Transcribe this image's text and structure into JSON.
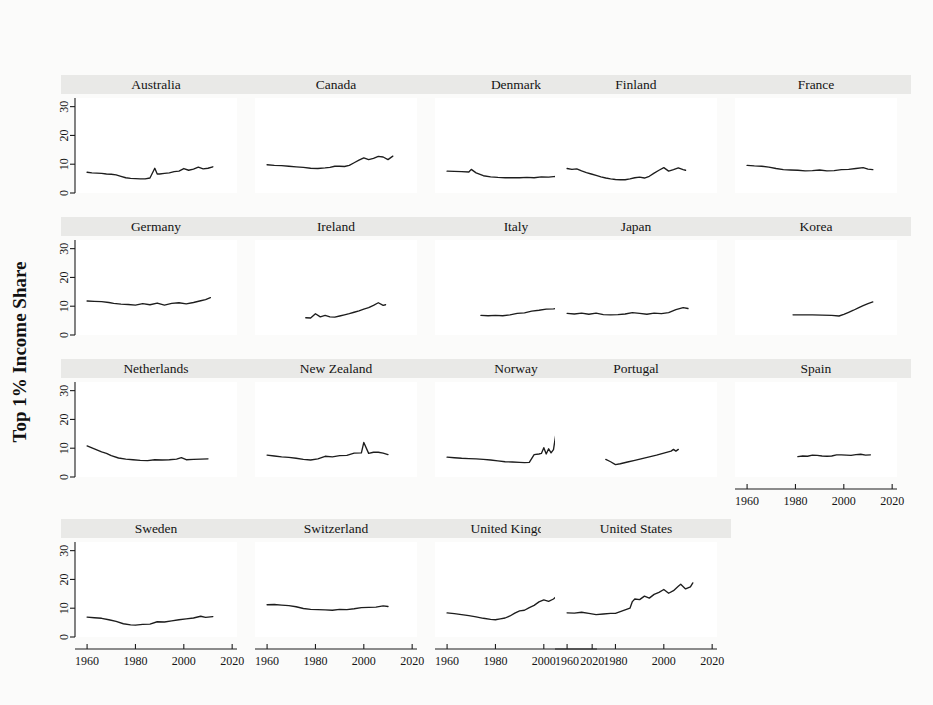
{
  "figure": {
    "ylabel": "Top 1% Income Share",
    "background_color": "#fbfbfa",
    "panel_background_color": "#ffffff",
    "title_band_color": "#e9e9e7",
    "line_color": "#1d1d1d"
  },
  "chart_data": {
    "type": "line",
    "title": "",
    "subtitle": "",
    "xlabel": "",
    "ylabel": "Top 1% Income Share",
    "xlim": [
      1955,
      2022
    ],
    "ylim": [
      0,
      33
    ],
    "xticks": [
      1960,
      1980,
      2000,
      2020
    ],
    "xtick_labels": [
      "1960",
      "1980",
      "2000",
      "2020"
    ],
    "yticks": [
      0,
      10,
      20,
      30
    ],
    "ytick_labels": [
      "0",
      "10",
      "20",
      "30"
    ],
    "grid": false,
    "legend": "none",
    "layout": {
      "rows": 4,
      "cols": 5,
      "panels": 19
    },
    "panels": [
      {
        "name": "Australia",
        "row": 0,
        "col": 0,
        "x": [
          1960,
          1962,
          1964,
          1966,
          1968,
          1970,
          1972,
          1974,
          1976,
          1978,
          1980,
          1982,
          1984,
          1986,
          1988,
          1989,
          1990,
          1992,
          1994,
          1996,
          1998,
          2000,
          2002,
          2004,
          2006,
          2008,
          2010,
          2012
        ],
        "y": [
          7.2,
          7.0,
          6.9,
          6.8,
          6.6,
          6.5,
          6.3,
          5.8,
          5.3,
          5.1,
          5.0,
          4.9,
          4.9,
          5.2,
          8.6,
          6.6,
          6.6,
          6.8,
          7.0,
          7.4,
          7.6,
          8.5,
          7.9,
          8.3,
          9.0,
          8.4,
          8.6,
          9.1
        ]
      },
      {
        "name": "Canada",
        "row": 0,
        "col": 1,
        "x": [
          1960,
          1963,
          1966,
          1969,
          1972,
          1975,
          1978,
          1981,
          1984,
          1986,
          1988,
          1990,
          1992,
          1994,
          1996,
          1998,
          2000,
          2002,
          2004,
          2006,
          2008,
          2010,
          2012
        ],
        "y": [
          9.8,
          9.6,
          9.5,
          9.3,
          9.1,
          8.9,
          8.6,
          8.5,
          8.7,
          8.9,
          9.3,
          9.3,
          9.2,
          9.6,
          10.5,
          11.4,
          12.2,
          11.6,
          12.0,
          12.7,
          12.5,
          11.6,
          12.8
        ]
      },
      {
        "name": "Denmark",
        "row": 0,
        "col": 2,
        "x": [
          1960,
          1963,
          1966,
          1969,
          1970,
          1972,
          1975,
          1978,
          1981,
          1984,
          1987,
          1990,
          1993,
          1996,
          1999,
          2002,
          2005,
          2008,
          2010
        ],
        "y": [
          7.6,
          7.5,
          7.4,
          7.3,
          8.2,
          7.0,
          6.0,
          5.6,
          5.4,
          5.3,
          5.3,
          5.3,
          5.4,
          5.3,
          5.6,
          5.5,
          5.8,
          5.6,
          5.6
        ]
      },
      {
        "name": "Finland",
        "row": 0,
        "col": 3,
        "x": [
          1960,
          1962,
          1964,
          1966,
          1968,
          1970,
          1972,
          1974,
          1976,
          1978,
          1980,
          1982,
          1984,
          1986,
          1988,
          1990,
          1992,
          1994,
          1996,
          1998,
          2000,
          2002,
          2004,
          2006,
          2008,
          2009
        ],
        "y": [
          8.5,
          8.2,
          8.4,
          7.7,
          7.1,
          6.6,
          6.1,
          5.6,
          5.2,
          4.9,
          4.7,
          4.6,
          4.6,
          4.9,
          5.3,
          5.5,
          5.2,
          5.8,
          6.9,
          7.9,
          8.8,
          7.6,
          8.1,
          8.7,
          8.1,
          7.9
        ]
      },
      {
        "name": "France",
        "row": 0,
        "col": 4,
        "x": [
          1960,
          1963,
          1966,
          1969,
          1972,
          1975,
          1978,
          1981,
          1984,
          1987,
          1990,
          1993,
          1996,
          1999,
          2002,
          2005,
          2008,
          2010,
          2012
        ],
        "y": [
          9.6,
          9.4,
          9.3,
          9.0,
          8.5,
          8.1,
          8.0,
          7.9,
          7.7,
          7.8,
          8.0,
          7.7,
          7.8,
          8.1,
          8.2,
          8.5,
          8.8,
          8.3,
          8.1
        ]
      },
      {
        "name": "Germany",
        "row": 1,
        "col": 0,
        "x": [
          1960,
          1963,
          1966,
          1969,
          1971,
          1974,
          1977,
          1980,
          1983,
          1986,
          1989,
          1992,
          1995,
          1998,
          2001,
          2004,
          2007,
          2009,
          2011
        ],
        "y": [
          11.8,
          11.7,
          11.6,
          11.3,
          11.0,
          10.7,
          10.6,
          10.4,
          10.9,
          10.5,
          11.1,
          10.4,
          11.0,
          11.2,
          10.8,
          11.3,
          11.9,
          12.3,
          13.0
        ]
      },
      {
        "name": "Ireland",
        "row": 1,
        "col": 1,
        "x": [
          1976,
          1978,
          1980,
          1982,
          1984,
          1986,
          1988,
          1990,
          1992,
          1994,
          1996,
          1998,
          2000,
          2002,
          2004,
          2006,
          2008,
          2009
        ],
        "y": [
          6.0,
          5.9,
          7.4,
          6.3,
          6.8,
          6.3,
          6.2,
          6.6,
          7.0,
          7.4,
          7.9,
          8.4,
          9.0,
          9.5,
          10.3,
          11.2,
          10.3,
          10.5
        ]
      },
      {
        "name": "Italy",
        "row": 1,
        "col": 2,
        "x": [
          1974,
          1977,
          1980,
          1983,
          1986,
          1989,
          1992,
          1995,
          1998,
          2001,
          2004,
          2007,
          2009
        ],
        "y": [
          6.8,
          6.7,
          6.8,
          6.7,
          7.0,
          7.5,
          7.7,
          8.3,
          8.6,
          9.0,
          9.1,
          9.4,
          9.4
        ]
      },
      {
        "name": "Japan",
        "row": 1,
        "col": 3,
        "x": [
          1960,
          1963,
          1966,
          1969,
          1972,
          1975,
          1978,
          1981,
          1984,
          1987,
          1990,
          1993,
          1996,
          1999,
          2002,
          2005,
          2008,
          2010
        ],
        "y": [
          7.5,
          7.3,
          7.6,
          7.2,
          7.6,
          7.1,
          7.0,
          7.1,
          7.3,
          7.8,
          7.5,
          7.2,
          7.6,
          7.4,
          7.8,
          8.8,
          9.5,
          9.2
        ]
      },
      {
        "name": "Korea",
        "row": 1,
        "col": 4,
        "x": [
          1979,
          1983,
          1987,
          1991,
          1995,
          1998,
          2000,
          2002,
          2004,
          2006,
          2008,
          2010,
          2012
        ],
        "y": [
          7.0,
          7.0,
          7.0,
          6.9,
          6.8,
          6.6,
          7.2,
          7.9,
          8.6,
          9.4,
          10.2,
          10.9,
          11.5
        ]
      },
      {
        "name": "Netherlands",
        "row": 2,
        "col": 0,
        "x": [
          1960,
          1962,
          1964,
          1966,
          1968,
          1970,
          1973,
          1976,
          1979,
          1982,
          1985,
          1988,
          1991,
          1994,
          1997,
          1999,
          2001,
          2004,
          2007,
          2010
        ],
        "y": [
          10.8,
          10.1,
          9.4,
          8.7,
          8.2,
          7.4,
          6.6,
          6.2,
          6.0,
          5.8,
          5.7,
          6.0,
          5.9,
          6.0,
          6.2,
          6.7,
          6.0,
          6.1,
          6.2,
          6.3
        ]
      },
      {
        "name": "New Zealand",
        "row": 2,
        "col": 1,
        "x": [
          1960,
          1963,
          1966,
          1969,
          1972,
          1975,
          1978,
          1981,
          1984,
          1987,
          1990,
          1993,
          1996,
          1999,
          2000,
          2002,
          2004,
          2006,
          2008,
          2010
        ],
        "y": [
          7.6,
          7.3,
          7.0,
          6.8,
          6.5,
          6.1,
          5.9,
          6.3,
          7.2,
          7.0,
          7.4,
          7.5,
          8.3,
          8.4,
          12.0,
          8.2,
          8.6,
          8.6,
          8.3,
          7.8
        ]
      },
      {
        "name": "Norway",
        "row": 2,
        "col": 2,
        "x": [
          1960,
          1963,
          1966,
          1969,
          1972,
          1975,
          1978,
          1981,
          1984,
          1987,
          1990,
          1992,
          1994,
          1996,
          1998,
          1999,
          2000,
          2001,
          2002,
          2003,
          2004,
          2005,
          2006,
          2007,
          2009,
          2011
        ],
        "y": [
          6.9,
          6.7,
          6.5,
          6.4,
          6.3,
          6.1,
          5.9,
          5.6,
          5.3,
          5.2,
          5.1,
          5.0,
          5.1,
          7.8,
          8.0,
          8.2,
          10.2,
          8.0,
          9.8,
          8.4,
          9.5,
          15.0,
          7.2,
          8.1,
          7.3,
          7.8
        ]
      },
      {
        "name": "Portugal",
        "row": 2,
        "col": 3,
        "x": [
          1976,
          1978,
          1980,
          1982,
          1985,
          1988,
          1991,
          1994,
          1997,
          2000,
          2003,
          2004,
          2005,
          2006
        ],
        "y": [
          6.1,
          5.3,
          4.3,
          4.6,
          5.2,
          5.8,
          6.4,
          7.0,
          7.6,
          8.3,
          9.0,
          9.6,
          9.0,
          9.6
        ]
      },
      {
        "name": "Spain",
        "row": 2,
        "col": 4,
        "x": [
          1981,
          1983,
          1985,
          1987,
          1989,
          1991,
          1993,
          1995,
          1997,
          1999,
          2001,
          2003,
          2005,
          2007,
          2009,
          2011
        ],
        "y": [
          7.1,
          7.3,
          7.2,
          7.6,
          7.5,
          7.3,
          7.2,
          7.3,
          7.7,
          7.7,
          7.6,
          7.5,
          7.8,
          7.9,
          7.6,
          7.7
        ],
        "has_xaxis": true
      },
      {
        "name": "Sweden",
        "row": 3,
        "col": 0,
        "x": [
          1960,
          1963,
          1966,
          1969,
          1972,
          1975,
          1978,
          1980,
          1983,
          1986,
          1989,
          1992,
          1995,
          1998,
          2001,
          2004,
          2007,
          2009,
          2012
        ],
        "y": [
          6.9,
          6.7,
          6.5,
          6.0,
          5.4,
          4.6,
          4.2,
          4.1,
          4.4,
          4.5,
          5.3,
          5.2,
          5.6,
          6.0,
          6.3,
          6.6,
          7.2,
          6.8,
          7.1
        ]
      },
      {
        "name": "Switzerland",
        "row": 3,
        "col": 1,
        "x": [
          1960,
          1963,
          1966,
          1969,
          1972,
          1975,
          1978,
          1981,
          1984,
          1987,
          1990,
          1993,
          1996,
          1999,
          2002,
          2005,
          2008,
          2010
        ],
        "y": [
          11.2,
          11.3,
          11.1,
          10.9,
          10.5,
          9.9,
          9.6,
          9.5,
          9.4,
          9.3,
          9.6,
          9.5,
          9.8,
          10.2,
          10.3,
          10.4,
          10.8,
          10.6
        ]
      },
      {
        "name": "United Kingdom",
        "row": 3,
        "col": 2,
        "x": [
          1960,
          1963,
          1966,
          1969,
          1972,
          1975,
          1978,
          1980,
          1982,
          1984,
          1986,
          1988,
          1990,
          1992,
          1994,
          1996,
          1998,
          2000,
          2002,
          2004,
          2006,
          2007,
          2008,
          2010,
          2011
        ],
        "y": [
          8.4,
          8.1,
          7.8,
          7.4,
          7.0,
          6.5,
          6.1,
          6.0,
          6.3,
          6.6,
          7.3,
          8.3,
          9.1,
          9.3,
          10.2,
          11.0,
          12.2,
          12.9,
          12.4,
          13.2,
          14.7,
          15.4,
          15.4,
          12.6,
          12.9
        ]
      },
      {
        "name": "United States",
        "row": 3,
        "col": 3,
        "x": [
          1960,
          1963,
          1966,
          1969,
          1972,
          1975,
          1978,
          1980,
          1982,
          1984,
          1986,
          1987,
          1988,
          1990,
          1992,
          1994,
          1996,
          1998,
          2000,
          2002,
          2004,
          2006,
          2007,
          2009,
          2011,
          2012
        ],
        "y": [
          8.4,
          8.3,
          8.6,
          8.2,
          7.8,
          8.0,
          8.2,
          8.2,
          8.8,
          9.4,
          10.0,
          12.3,
          13.2,
          13.0,
          14.2,
          13.5,
          14.8,
          15.5,
          16.5,
          15.2,
          16.1,
          17.6,
          18.3,
          16.7,
          17.4,
          18.8
        ]
      }
    ]
  }
}
